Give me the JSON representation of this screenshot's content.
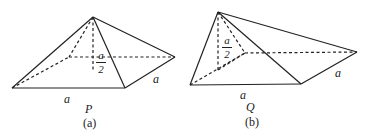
{
  "figures": [
    {
      "id": "a",
      "solid_label": "P",
      "caption": "(a)",
      "base_edge_label": "a",
      "side_edge_label": "a",
      "height_label": {
        "numerator": "a",
        "denominator": "2"
      }
    },
    {
      "id": "b",
      "solid_label": "Q",
      "caption": "(b)",
      "base_edge_label": "a",
      "side_edge_label": "a",
      "height_label": {
        "numerator": "a",
        "denominator": "2"
      }
    }
  ],
  "colors": {
    "line": "#222222",
    "background": "#ffffff"
  }
}
